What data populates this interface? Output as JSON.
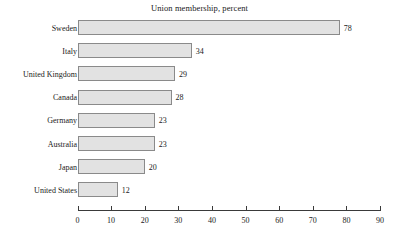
{
  "chart_data": {
    "type": "bar",
    "orientation": "horizontal",
    "title": "Union membership, percent",
    "xlabel": "",
    "ylabel": "",
    "categories": [
      "Sweden",
      "Italy",
      "United Kingdom",
      "Canada",
      "Germany",
      "Australia",
      "Japan",
      "United States"
    ],
    "values": [
      78,
      34,
      29,
      28,
      23,
      23,
      20,
      12
    ],
    "data_labels": [
      "78",
      "34",
      "29",
      "28",
      "23",
      "23",
      "20",
      "12"
    ],
    "xlim": [
      0,
      90
    ],
    "xticks": [
      0,
      10,
      20,
      30,
      40,
      50,
      60,
      70,
      80,
      90
    ],
    "xtick_labels": [
      "0",
      "10",
      "20",
      "30",
      "40",
      "50",
      "60",
      "70",
      "80",
      "90"
    ],
    "grid": false,
    "legend": false,
    "bar_fill_color": "#e2e2e2",
    "bar_border_color": "#8a8a8a",
    "axis_color": "#3a3a3a",
    "background_color": "#ffffff"
  }
}
